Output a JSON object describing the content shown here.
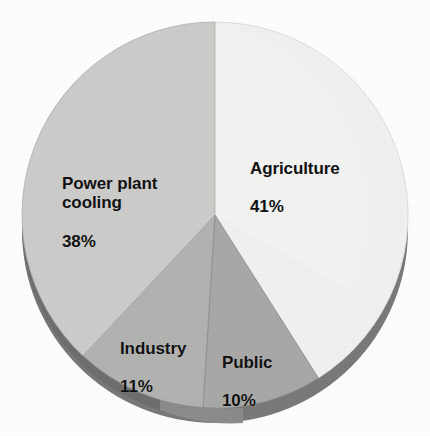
{
  "chart_data": {
    "type": "pie",
    "title": "",
    "subtitle": "",
    "xlabel": "",
    "ylabel": "",
    "legend_position": "none",
    "grid": false,
    "labels_on_slices": true,
    "start_angle_deg": 0,
    "direction": "clockwise",
    "categories": [
      "Agriculture",
      "Public",
      "Industry",
      "Power plant cooling"
    ],
    "values": [
      41,
      10,
      11,
      38
    ],
    "value_unit": "%",
    "slices": [
      {
        "name": "Agriculture",
        "label": "Agriculture",
        "value": 41,
        "value_text": "41%",
        "color": "#f2f2f0",
        "start_deg": 0,
        "end_deg": 147.6
      },
      {
        "name": "Public",
        "label": "Public",
        "value": 10,
        "value_text": "10%",
        "color": "#a9a9a7",
        "start_deg": 147.6,
        "end_deg": 183.6
      },
      {
        "name": "Industry",
        "label": "Industry",
        "value": 11,
        "value_text": "11%",
        "color": "#b3b3b1",
        "start_deg": 183.6,
        "end_deg": 223.2
      },
      {
        "name": "Power plant cooling",
        "label": "Power plant\ncooling",
        "value": 38,
        "value_text": "38%",
        "color": "#cdcdcb",
        "start_deg": 223.2,
        "end_deg": 360
      }
    ]
  },
  "colors": {
    "background": "#ffffff",
    "agriculture": "#f2f2f0",
    "public": "#a9a9a7",
    "industry": "#b3b3b1",
    "power_plant_cooling": "#cdcdcb",
    "depth_edge": "#7a7a78",
    "slice_divider": "#8d8d8b",
    "label_text": "#111111"
  },
  "labels": {
    "agriculture": {
      "name": "Agriculture",
      "value": "41%"
    },
    "power_plant_cooling": {
      "name": "Power plant\ncooling",
      "value": "38%"
    },
    "industry": {
      "name": "Industry",
      "value": "11%"
    },
    "public": {
      "name": "Public",
      "value": "10%"
    }
  }
}
